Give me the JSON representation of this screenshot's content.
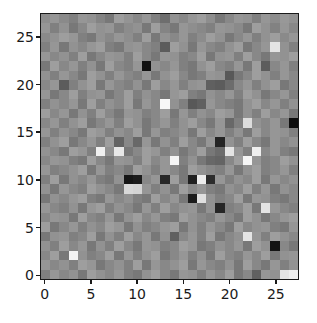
{
  "figure": {
    "background_color": "#ffffff",
    "axes_edge_color": "#1a1a1a",
    "tick_color": "#1a1a1a",
    "tick_label_color": "#1a1a1a"
  },
  "chart_data": {
    "type": "heatmap",
    "title": "",
    "xlabel": "",
    "ylabel": "",
    "colormap": "gray",
    "grid": false,
    "legend": null,
    "colorbar": false,
    "origin": "upper",
    "rows": 28,
    "cols": 28,
    "xlim": [
      -0.5,
      27.5
    ],
    "ylim": [
      27.5,
      -0.5
    ],
    "vmin": 0,
    "vmax": 255,
    "x_tick_labels": [
      "0",
      "5",
      "10",
      "15",
      "20",
      "25"
    ],
    "x_tick_values": [
      0,
      5,
      10,
      15,
      20,
      25
    ],
    "y_tick_labels": [
      "0",
      "5",
      "10",
      "15",
      "20",
      "25"
    ],
    "y_tick_values": [
      0,
      5,
      10,
      15,
      20,
      25
    ],
    "values": [
      [
        142,
        150,
        138,
        128,
        150,
        146,
        132,
        120,
        158,
        148,
        136,
        150,
        128,
        110,
        146,
        136,
        150,
        158,
        142,
        120,
        136,
        150,
        146,
        128,
        150,
        140,
        152,
        146
      ],
      [
        150,
        128,
        146,
        120,
        136,
        158,
        146,
        150,
        128,
        140,
        146,
        120,
        158,
        132,
        120,
        150,
        142,
        136,
        128,
        150,
        146,
        138,
        120,
        158,
        146,
        130,
        150,
        136
      ],
      [
        138,
        146,
        158,
        150,
        128,
        120,
        146,
        136,
        150,
        142,
        128,
        158,
        120,
        146,
        136,
        150,
        128,
        140,
        158,
        146,
        120,
        136,
        150,
        128,
        146,
        158,
        138,
        150
      ],
      [
        128,
        150,
        120,
        146,
        136,
        150,
        158,
        128,
        120,
        146,
        150,
        136,
        128,
        92,
        158,
        146,
        120,
        150,
        136,
        128,
        146,
        158,
        120,
        136,
        150,
        228,
        146,
        128
      ],
      [
        150,
        136,
        146,
        128,
        158,
        120,
        136,
        150,
        146,
        128,
        158,
        136,
        120,
        150,
        146,
        128,
        136,
        158,
        120,
        146,
        150,
        128,
        158,
        136,
        120,
        150,
        146,
        158
      ],
      [
        120,
        158,
        136,
        150,
        128,
        146,
        120,
        158,
        136,
        128,
        150,
        18,
        146,
        136,
        150,
        128,
        120,
        146,
        158,
        136,
        128,
        150,
        120,
        158,
        92,
        136,
        150,
        128
      ],
      [
        146,
        128,
        150,
        136,
        120,
        158,
        146,
        128,
        150,
        136,
        128,
        150,
        120,
        146,
        158,
        136,
        120,
        128,
        150,
        146,
        88,
        120,
        136,
        158,
        146,
        128,
        150,
        136
      ],
      [
        136,
        150,
        92,
        128,
        146,
        158,
        120,
        150,
        136,
        128,
        146,
        120,
        158,
        136,
        150,
        128,
        146,
        150,
        96,
        92,
        108,
        136,
        150,
        128,
        146,
        158,
        120,
        136
      ],
      [
        150,
        120,
        136,
        158,
        128,
        146,
        150,
        120,
        136,
        158,
        128,
        146,
        136,
        120,
        150,
        158,
        128,
        120,
        146,
        136,
        150,
        128,
        158,
        146,
        120,
        136,
        150,
        128
      ],
      [
        128,
        146,
        136,
        150,
        120,
        158,
        128,
        146,
        136,
        158,
        120,
        150,
        136,
        248,
        146,
        128,
        88,
        96,
        150,
        136,
        128,
        120,
        146,
        158,
        136,
        150,
        128,
        146
      ],
      [
        158,
        136,
        150,
        120,
        146,
        128,
        158,
        136,
        120,
        150,
        146,
        128,
        136,
        158,
        120,
        150,
        128,
        146,
        136,
        158,
        150,
        120,
        146,
        128,
        158,
        136,
        150,
        120
      ],
      [
        136,
        150,
        128,
        146,
        158,
        120,
        136,
        150,
        128,
        158,
        146,
        120,
        136,
        150,
        128,
        146,
        158,
        136,
        120,
        150,
        104,
        128,
        220,
        146,
        136,
        150,
        120,
        14
      ],
      [
        150,
        128,
        146,
        136,
        120,
        158,
        150,
        128,
        146,
        136,
        158,
        120,
        150,
        128,
        136,
        146,
        120,
        158,
        136,
        150,
        128,
        146,
        120,
        158,
        136,
        150,
        146,
        128
      ],
      [
        128,
        146,
        158,
        120,
        136,
        150,
        128,
        158,
        100,
        136,
        104,
        150,
        120,
        146,
        128,
        158,
        136,
        120,
        150,
        36,
        146,
        128,
        158,
        136,
        120,
        150,
        136,
        146
      ],
      [
        146,
        136,
        120,
        158,
        150,
        128,
        240,
        146,
        232,
        120,
        136,
        158,
        150,
        128,
        146,
        120,
        136,
        158,
        120,
        108,
        228,
        150,
        128,
        238,
        136,
        150,
        128,
        120
      ],
      [
        136,
        150,
        146,
        128,
        120,
        158,
        136,
        120,
        150,
        146,
        128,
        158,
        136,
        150,
        244,
        128,
        146,
        120,
        104,
        100,
        136,
        158,
        246,
        150,
        128,
        136,
        158,
        146
      ],
      [
        150,
        128,
        136,
        146,
        158,
        120,
        150,
        128,
        136,
        120,
        158,
        146,
        128,
        150,
        136,
        120,
        158,
        146,
        136,
        128,
        150,
        120,
        146,
        158,
        128,
        136,
        150,
        128
      ],
      [
        128,
        158,
        120,
        146,
        136,
        150,
        128,
        120,
        146,
        22,
        28,
        136,
        150,
        40,
        158,
        120,
        32,
        236,
        44,
        150,
        128,
        146,
        136,
        158,
        120,
        150,
        136,
        146
      ],
      [
        146,
        120,
        150,
        136,
        128,
        158,
        146,
        136,
        120,
        216,
        212,
        150,
        128,
        146,
        120,
        158,
        136,
        150,
        128,
        120,
        146,
        136,
        158,
        128,
        150,
        120,
        146,
        136
      ],
      [
        120,
        146,
        136,
        150,
        158,
        128,
        120,
        150,
        136,
        146,
        128,
        120,
        158,
        136,
        150,
        120,
        28,
        224,
        146,
        128,
        136,
        158,
        120,
        150,
        146,
        128,
        120,
        136
      ],
      [
        150,
        136,
        128,
        146,
        120,
        150,
        158,
        128,
        146,
        136,
        120,
        150,
        128,
        158,
        136,
        146,
        150,
        120,
        146,
        38,
        128,
        136,
        158,
        120,
        228,
        150,
        136,
        128
      ],
      [
        136,
        150,
        146,
        120,
        158,
        136,
        128,
        150,
        120,
        146,
        158,
        136,
        150,
        128,
        120,
        158,
        146,
        136,
        128,
        150,
        136,
        120,
        158,
        146,
        120,
        136,
        150,
        158
      ],
      [
        158,
        120,
        136,
        150,
        128,
        146,
        136,
        158,
        150,
        120,
        146,
        128,
        136,
        150,
        158,
        120,
        146,
        128,
        150,
        136,
        120,
        158,
        136,
        146,
        150,
        128,
        120,
        150
      ],
      [
        120,
        146,
        150,
        128,
        136,
        158,
        120,
        146,
        128,
        158,
        136,
        150,
        120,
        146,
        96,
        136,
        150,
        128,
        158,
        120,
        136,
        146,
        228,
        150,
        128,
        158,
        146,
        136
      ],
      [
        146,
        128,
        158,
        136,
        150,
        120,
        146,
        128,
        158,
        136,
        120,
        150,
        146,
        128,
        136,
        158,
        150,
        120,
        128,
        146,
        136,
        150,
        120,
        158,
        146,
        20,
        136,
        120
      ],
      [
        136,
        158,
        120,
        244,
        146,
        128,
        136,
        158,
        120,
        150,
        128,
        146,
        158,
        120,
        136,
        150,
        128,
        146,
        120,
        158,
        136,
        128,
        150,
        136,
        158,
        120,
        146,
        150
      ],
      [
        150,
        136,
        146,
        128,
        158,
        150,
        120,
        136,
        146,
        128,
        158,
        120,
        150,
        136,
        146,
        158,
        120,
        150,
        136,
        128,
        146,
        120,
        158,
        136,
        120,
        150,
        128,
        146
      ],
      [
        128,
        150,
        136,
        146,
        120,
        158,
        146,
        136,
        150,
        128,
        120,
        146,
        158,
        136,
        120,
        150,
        146,
        128,
        150,
        136,
        158,
        120,
        136,
        96,
        150,
        146,
        228,
        238
      ]
    ]
  }
}
